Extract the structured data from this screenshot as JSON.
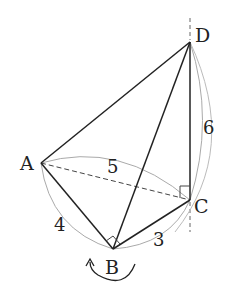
{
  "diagram": {
    "points": {
      "A": {
        "label": "A",
        "x": 41,
        "y": 163
      },
      "B": {
        "label": "B",
        "x": 113,
        "y": 249
      },
      "C": {
        "label": "C",
        "x": 190,
        "y": 200
      },
      "D": {
        "label": "D",
        "x": 190,
        "y": 42
      }
    },
    "lengths": {
      "AB": "4",
      "BC": "3",
      "AC": "5",
      "CD": "6"
    },
    "right_angles": [
      "ABC",
      "ACD"
    ],
    "colors": {
      "line": "#222222",
      "arc": "#aaaaaa",
      "dashed": "#444444"
    }
  }
}
